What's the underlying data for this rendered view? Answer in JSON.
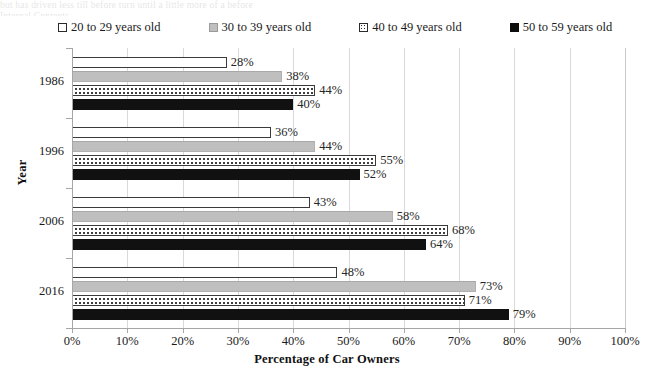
{
  "background_text": {
    "line1": "but has driven less till before turn until a little more of a before",
    "line2": "Internal Contents"
  },
  "chart_data": {
    "type": "bar",
    "orientation": "horizontal",
    "title": "",
    "xlabel": "Percentage of Car Owners",
    "ylabel": "Year",
    "categories": [
      "1986",
      "1996",
      "2006",
      "2016"
    ],
    "series": [
      {
        "name": "20 to 29 years old",
        "values": [
          28,
          38,
          43,
          48
        ],
        "swatch": "white",
        "color": "#ffffff"
      },
      {
        "name": "30 to 39 years old",
        "values": [
          38,
          44,
          58,
          73
        ],
        "swatch": "gray",
        "color": "#bfbfbf"
      },
      {
        "name": "40 to 49 years old",
        "values": [
          44,
          55,
          68,
          71
        ],
        "swatch": "dotted",
        "color": "#ffffff"
      },
      {
        "name": "50 to 59 years old",
        "values": [
          40,
          52,
          64,
          79
        ],
        "swatch": "black",
        "color": "#111111"
      }
    ],
    "value_labels": [
      [
        "28%",
        "38%",
        "44%",
        "40%"
      ],
      [
        "36%",
        "44%",
        "55%",
        "52%"
      ],
      [
        "43%",
        "58%",
        "68%",
        "64%"
      ],
      [
        "48%",
        "73%",
        "71%",
        "79%"
      ]
    ],
    "series_values_corrected": [
      {
        "name": "20 to 29 years old",
        "values": [
          28,
          36,
          43,
          48
        ]
      },
      {
        "name": "30 to 39 years old",
        "values": [
          38,
          44,
          58,
          73
        ]
      },
      {
        "name": "40 to 49 years old",
        "values": [
          44,
          55,
          68,
          71
        ]
      },
      {
        "name": "50 to 59 years old",
        "values": [
          40,
          52,
          64,
          79
        ]
      }
    ],
    "xlim": [
      0,
      100
    ],
    "xticks": [
      0,
      10,
      20,
      30,
      40,
      50,
      60,
      70,
      80,
      90,
      100
    ],
    "xtick_labels": [
      "0%",
      "10%",
      "20%",
      "30%",
      "40%",
      "50%",
      "60%",
      "70%",
      "80%",
      "90%",
      "100%"
    ],
    "grid": "vertical",
    "legend_position": "top"
  },
  "legend": {
    "items": [
      {
        "label": "20 to 29 years old",
        "swatch": "white"
      },
      {
        "label": "30 to 39 years old",
        "swatch": "gray"
      },
      {
        "label": "40 to 49 years old",
        "swatch": "dotted"
      },
      {
        "label": "50 to 59 years old",
        "swatch": "black"
      }
    ]
  },
  "axes": {
    "y_title": "Year",
    "x_title": "Percentage of Car Owners"
  }
}
